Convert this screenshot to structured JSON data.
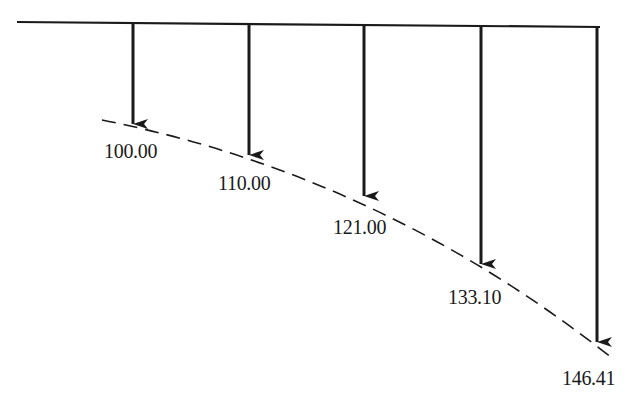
{
  "diagram": {
    "colors": {
      "line": "#1a1a1a",
      "background": "#ffffff"
    },
    "time_line": {
      "x1": 17,
      "y1": 22,
      "x2": 600,
      "y2": 27
    },
    "growth_curve": {
      "style": "dashed",
      "path": "M 102 120 Q 380 175 612 358"
    },
    "values": [
      {
        "label": "100.00",
        "x": 133,
        "tip_y": 124,
        "label_x": 104,
        "label_y": 141
      },
      {
        "label": "110.00",
        "x": 249,
        "tip_y": 155,
        "label_x": 218,
        "label_y": 173
      },
      {
        "label": "121.00",
        "x": 364,
        "tip_y": 196,
        "label_x": 333,
        "label_y": 217
      },
      {
        "label": "133.10",
        "x": 481,
        "tip_y": 264,
        "label_x": 448,
        "label_y": 287
      },
      {
        "label": "146.41",
        "x": 597,
        "tip_y": 342,
        "label_x": 562,
        "label_y": 368
      }
    ]
  }
}
